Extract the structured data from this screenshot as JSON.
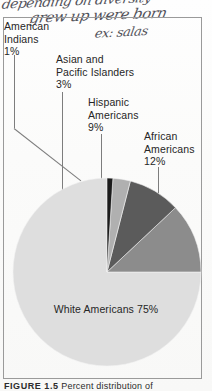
{
  "handwriting": {
    "line1": "depending on diversity",
    "line2": "grew up were born",
    "line3": "ex: salas"
  },
  "figure": {
    "caption_label": "FIGURE 1.5",
    "caption_body": "Percent distribution of"
  },
  "labels": {
    "american_indians": "American\nIndians\n1%",
    "asian_pacific": "Asian and\nPacific Islanders\n3%",
    "hispanic": "Hispanic\nAmericans\n9%",
    "african": "African\nAmericans\n12%",
    "white": "White Americans 75%"
  },
  "chart_data": {
    "type": "pie",
    "title": "Percent distribution of",
    "categories": [
      "White Americans",
      "African Americans",
      "Hispanic Americans",
      "Asian and Pacific Islanders",
      "American Indians"
    ],
    "values": [
      75,
      12,
      9,
      3,
      1
    ],
    "value_suffix": "%",
    "colors": [
      "#dedede",
      "#8c8c8c",
      "#5b5b5b",
      "#b0b0b0",
      "#1c1c1c"
    ],
    "legend": "callout-labels",
    "grid": false,
    "start_angle_deg": -90,
    "direction": "counterclockwise"
  }
}
